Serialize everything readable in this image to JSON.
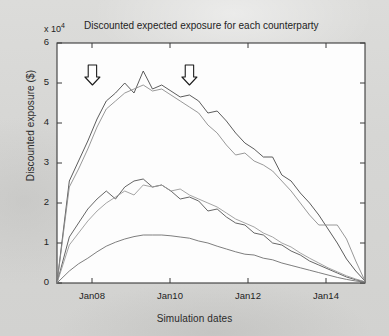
{
  "chart_data": {
    "type": "line",
    "title": "Discounted expected exposure for each counterparty",
    "xlabel": "Simulation dates",
    "ylabel": "Discounted exposure ($)",
    "y_multiplier": "x 10",
    "y_multiplier_exponent": "4",
    "ylim": [
      0,
      6
    ],
    "yticks": [
      0,
      1,
      2,
      3,
      4,
      5,
      6
    ],
    "ytick_labels": [
      "0",
      "1",
      "2",
      "3",
      "4",
      "5",
      "6"
    ],
    "xlim": [
      "Jan07",
      "Jan15"
    ],
    "xticks": [
      "Jan08",
      "Jan10",
      "Jan12",
      "Jan14"
    ],
    "xtick_labels": [
      "Jan08",
      "Jan10",
      "Jan12",
      "Jan14"
    ],
    "grid": false,
    "legend": "none",
    "annotations": [
      {
        "text": "Diffusion effect",
        "arrow": "down-arrow",
        "x_frac": 0.115,
        "label_x": 0.08
      },
      {
        "text": "Amortization effect",
        "arrow": "down-arrow",
        "x_frac": 0.43,
        "label_x": 0.345
      }
    ],
    "series": [
      {
        "name": "counterparty-1",
        "color": "#4a4a4a",
        "x": [
          0.0,
          0.04,
          0.07,
          0.1,
          0.13,
          0.16,
          0.19,
          0.22,
          0.25,
          0.28,
          0.31,
          0.34,
          0.37,
          0.4,
          0.43,
          0.46,
          0.49,
          0.52,
          0.55,
          0.58,
          0.61,
          0.64,
          0.67,
          0.7,
          0.73,
          0.76,
          0.79,
          0.82,
          0.85,
          0.88,
          0.91,
          0.94,
          0.97,
          1.0
        ],
        "y": [
          0.0,
          2.55,
          3.05,
          3.55,
          4.1,
          4.55,
          4.75,
          5.0,
          4.75,
          5.3,
          4.85,
          4.95,
          4.8,
          4.65,
          4.7,
          4.55,
          4.25,
          4.3,
          4.05,
          3.75,
          3.5,
          3.35,
          3.15,
          3.15,
          2.7,
          2.55,
          2.25,
          2.0,
          1.7,
          1.35,
          1.0,
          0.6,
          0.3,
          0.05
        ]
      },
      {
        "name": "counterparty-2",
        "color": "#8c8c8c",
        "x": [
          0.0,
          0.04,
          0.07,
          0.1,
          0.13,
          0.16,
          0.19,
          0.22,
          0.25,
          0.28,
          0.31,
          0.34,
          0.37,
          0.4,
          0.43,
          0.46,
          0.49,
          0.52,
          0.55,
          0.58,
          0.61,
          0.64,
          0.67,
          0.7,
          0.73,
          0.76,
          0.79,
          0.82,
          0.85,
          0.88,
          0.91,
          0.94,
          0.97,
          1.0
        ],
        "y": [
          0.0,
          2.4,
          2.85,
          3.35,
          3.9,
          4.35,
          4.55,
          4.75,
          4.85,
          4.95,
          4.8,
          4.85,
          4.7,
          4.55,
          4.4,
          4.25,
          3.95,
          3.75,
          3.45,
          3.2,
          3.25,
          3.05,
          2.95,
          2.8,
          2.55,
          2.3,
          2.0,
          1.7,
          1.45,
          1.45,
          1.45,
          1.1,
          0.55,
          0.05
        ]
      },
      {
        "name": "counterparty-3",
        "color": "#555555",
        "x": [
          0.0,
          0.04,
          0.07,
          0.1,
          0.13,
          0.16,
          0.19,
          0.22,
          0.25,
          0.28,
          0.31,
          0.34,
          0.37,
          0.4,
          0.43,
          0.46,
          0.49,
          0.52,
          0.55,
          0.58,
          0.61,
          0.64,
          0.67,
          0.7,
          0.73,
          0.76,
          0.79,
          0.82,
          0.85,
          0.88,
          0.91,
          0.94,
          0.97,
          1.0
        ],
        "y": [
          0.0,
          1.15,
          1.5,
          1.85,
          2.1,
          2.3,
          2.1,
          2.4,
          2.55,
          2.6,
          2.4,
          2.45,
          2.3,
          2.1,
          2.15,
          2.05,
          1.8,
          1.85,
          1.65,
          1.5,
          1.45,
          1.25,
          1.2,
          1.0,
          0.95,
          0.8,
          0.7,
          0.55,
          0.45,
          0.35,
          0.25,
          0.15,
          0.08,
          0.03
        ]
      },
      {
        "name": "counterparty-4",
        "color": "#9a9a9a",
        "x": [
          0.0,
          0.04,
          0.07,
          0.1,
          0.13,
          0.16,
          0.19,
          0.22,
          0.25,
          0.28,
          0.31,
          0.34,
          0.37,
          0.4,
          0.43,
          0.46,
          0.49,
          0.52,
          0.55,
          0.58,
          0.61,
          0.64,
          0.67,
          0.7,
          0.73,
          0.76,
          0.79,
          0.82,
          0.85,
          0.88,
          0.91,
          0.94,
          0.97,
          1.0
        ],
        "y": [
          0.0,
          0.95,
          1.25,
          1.55,
          1.8,
          2.0,
          2.15,
          2.3,
          2.2,
          2.45,
          2.4,
          2.45,
          2.3,
          2.35,
          2.2,
          2.1,
          2.0,
          1.9,
          1.75,
          1.6,
          1.5,
          1.4,
          1.25,
          1.15,
          1.0,
          0.9,
          0.75,
          0.62,
          0.5,
          0.38,
          0.28,
          0.18,
          0.1,
          0.03
        ]
      },
      {
        "name": "counterparty-5",
        "color": "#6f6f6f",
        "x": [
          0.0,
          0.04,
          0.07,
          0.1,
          0.13,
          0.16,
          0.19,
          0.22,
          0.25,
          0.28,
          0.31,
          0.34,
          0.37,
          0.4,
          0.43,
          0.46,
          0.49,
          0.52,
          0.55,
          0.58,
          0.61,
          0.64,
          0.67,
          0.7,
          0.73,
          0.76,
          0.79,
          0.82,
          0.85,
          0.88,
          0.91,
          0.94,
          0.97,
          1.0
        ],
        "y": [
          0.0,
          0.3,
          0.48,
          0.62,
          0.78,
          0.92,
          1.02,
          1.1,
          1.16,
          1.2,
          1.2,
          1.2,
          1.18,
          1.15,
          1.12,
          1.05,
          1.0,
          0.92,
          0.85,
          0.78,
          0.72,
          0.7,
          0.62,
          0.58,
          0.5,
          0.44,
          0.38,
          0.32,
          0.26,
          0.2,
          0.14,
          0.09,
          0.05,
          0.02
        ]
      }
    ]
  }
}
